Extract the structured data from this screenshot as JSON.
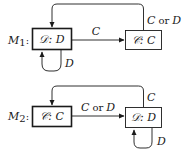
{
  "machines": [
    {
      "label": "M",
      "subscript": "1",
      "colon": ":",
      "start_state": {
        "label": "𝒟: D"
      },
      "other_state": {
        "label": "𝒞: C"
      },
      "edges": {
        "forward": "C",
        "back": "C or D",
        "back_prefix": "C",
        "back_or": "or",
        "back_suffix": "D",
        "self_loop": "D"
      }
    },
    {
      "label": "M",
      "subscript": "2",
      "colon": ":",
      "start_state": {
        "label": "𝒞: C"
      },
      "other_state": {
        "label": "𝒟: D"
      },
      "edges": {
        "forward": "C or D",
        "forward_prefix": "C",
        "forward_or": "or",
        "forward_suffix": "D",
        "back": "C",
        "self_loop": "D"
      }
    }
  ],
  "colors": {
    "stroke": "#1a1a1a",
    "background": "#ffffff"
  }
}
